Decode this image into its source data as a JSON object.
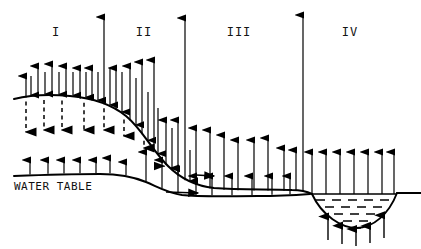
{
  "figure": {
    "kind": "hydrogeologic-cross-section",
    "width": 421,
    "height": 249,
    "background_color": "#ffffff",
    "ink_color": "#000000"
  },
  "labels": {
    "regions": [
      {
        "id": "region-1",
        "text": "I",
        "x": 56,
        "y": 33
      },
      {
        "id": "region-2",
        "text": "II",
        "x": 144,
        "y": 33
      },
      {
        "id": "region-3",
        "text": "III",
        "x": 239,
        "y": 33
      },
      {
        "id": "region-4",
        "text": "IV",
        "x": 350,
        "y": 33
      }
    ],
    "water_table": {
      "text": "WATER TABLE",
      "x": 14,
      "y": 180
    }
  },
  "surfaces": {
    "ground_surface": {
      "name": "land-surface-profile",
      "points": "M 14,99 C 30,95 48,94 70,96 C 92,98 110,103 126,116 C 142,129 152,150 168,166 C 182,180 196,186 214,188 C 240,190 268,189 292,190 C 300,190 306,191 312,194"
    },
    "water_table_line": {
      "name": "water-table-profile",
      "points": "M 14,176 C 40,175 70,174 100,174 C 120,174 134,177 146,182 C 158,187 168,193 182,195 C 200,197 230,196 258,196 C 280,196 296,195 310,194"
    },
    "lake": {
      "name": "lake-basin",
      "shore_left_x": 312,
      "shore_right_x": 397,
      "surface_y": 194,
      "bottom_y": 228,
      "fill_symbol": "horizontal-dashes",
      "dash_rows": 5
    },
    "ground_right_of_lake": {
      "name": "land-surface-right-shore",
      "points": "M 397,193 L 421,193"
    }
  },
  "flow": {
    "legend_note": "arrows denote groundwater flux direction and magnitude",
    "above_ground_up_arrows": [
      {
        "x": 26,
        "top": 76
      },
      {
        "x": 38,
        "top": 66
      },
      {
        "x": 52,
        "top": 64
      },
      {
        "x": 66,
        "top": 66
      },
      {
        "x": 80,
        "top": 68
      },
      {
        "x": 92,
        "top": 68
      },
      {
        "x": 104,
        "top": 17
      },
      {
        "x": 116,
        "top": 68
      },
      {
        "x": 130,
        "top": 66
      },
      {
        "x": 142,
        "top": 62
      },
      {
        "x": 154,
        "top": 60
      },
      {
        "x": 166,
        "top": 120
      },
      {
        "x": 178,
        "top": 120
      },
      {
        "x": 185,
        "top": 18
      },
      {
        "x": 196,
        "top": 128
      },
      {
        "x": 210,
        "top": 130
      },
      {
        "x": 224,
        "top": 135
      },
      {
        "x": 238,
        "top": 140
      },
      {
        "x": 254,
        "top": 140
      },
      {
        "x": 268,
        "top": 138
      },
      {
        "x": 284,
        "top": 148
      },
      {
        "x": 296,
        "top": 150
      },
      {
        "x": 303,
        "top": 15
      },
      {
        "x": 312,
        "top": 152
      },
      {
        "x": 326,
        "top": 152
      },
      {
        "x": 340,
        "top": 152
      },
      {
        "x": 354,
        "top": 152
      },
      {
        "x": 368,
        "top": 152
      },
      {
        "x": 382,
        "top": 152
      },
      {
        "x": 394,
        "top": 152
      }
    ],
    "above_ground_down_arrows": [
      {
        "x": 31,
        "top": 76
      },
      {
        "x": 45,
        "top": 72
      },
      {
        "x": 59,
        "top": 72
      },
      {
        "x": 73,
        "top": 72
      },
      {
        "x": 86,
        "top": 72
      },
      {
        "x": 98,
        "top": 72
      },
      {
        "x": 110,
        "top": 68
      },
      {
        "x": 122,
        "top": 72
      },
      {
        "x": 136,
        "top": 78
      },
      {
        "x": 148,
        "top": 92
      },
      {
        "x": 158,
        "top": 108
      },
      {
        "x": 172,
        "top": 128
      },
      {
        "x": 190,
        "top": 150
      }
    ],
    "subsurface_dashed_down_arrows": [
      {
        "x": 26,
        "top": 108
      },
      {
        "x": 44,
        "top": 106
      },
      {
        "x": 62,
        "top": 106
      },
      {
        "x": 84,
        "top": 106
      },
      {
        "x": 104,
        "top": 106
      },
      {
        "x": 124,
        "top": 112
      },
      {
        "x": 144,
        "top": 124
      },
      {
        "x": 164,
        "top": 142
      }
    ],
    "water_table_up_arrows": [
      {
        "x": 30,
        "top": 160
      },
      {
        "x": 48,
        "top": 160
      },
      {
        "x": 64,
        "top": 160
      },
      {
        "x": 80,
        "top": 160
      },
      {
        "x": 96,
        "top": 160
      },
      {
        "x": 110,
        "top": 158
      },
      {
        "x": 126,
        "top": 162
      },
      {
        "x": 146,
        "top": 152
      },
      {
        "x": 162,
        "top": 160
      },
      {
        "x": 178,
        "top": 168
      },
      {
        "x": 196,
        "top": 176
      },
      {
        "x": 212,
        "top": 176
      },
      {
        "x": 232,
        "top": 176
      },
      {
        "x": 252,
        "top": 176
      },
      {
        "x": 272,
        "top": 176
      },
      {
        "x": 290,
        "top": 176
      }
    ],
    "horizontal_arrows": [
      {
        "x1": 166,
        "y1": 192,
        "x2": 198,
        "y2": 193
      },
      {
        "x1": 196,
        "y1": 175,
        "x2": 214,
        "y2": 176
      }
    ],
    "lake_bed_up_arrows": [
      {
        "x": 328,
        "top": 240
      },
      {
        "x": 342,
        "top": 244
      },
      {
        "x": 356,
        "top": 246
      },
      {
        "x": 370,
        "top": 243
      },
      {
        "x": 384,
        "top": 238
      }
    ]
  }
}
